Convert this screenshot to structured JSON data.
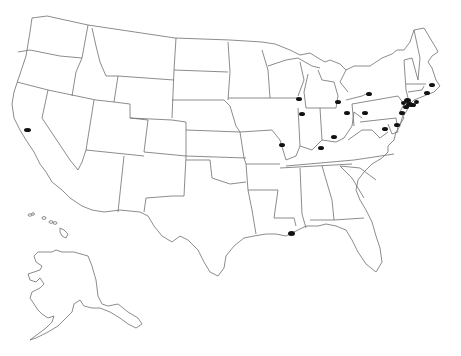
{
  "map": {
    "type": "us-states-outline",
    "background": "#ffffff",
    "outline_color": "#6e6e6e",
    "marker_color": "#111111",
    "insets": [
      "alaska",
      "hawaii"
    ]
  },
  "markers": [
    {
      "id": "san-francisco-ca",
      "x": 24,
      "y": 128,
      "w": 7,
      "h": 4
    },
    {
      "id": "new-orleans-la",
      "x": 288,
      "y": 231,
      "w": 7,
      "h": 5
    },
    {
      "id": "milwaukee-wi",
      "x": 296,
      "y": 97,
      "w": 6,
      "h": 4
    },
    {
      "id": "chicago-il",
      "x": 299,
      "y": 112,
      "w": 6,
      "h": 4
    },
    {
      "id": "st-louis-mo",
      "x": 279,
      "y": 143,
      "w": 6,
      "h": 4
    },
    {
      "id": "detroit-mi",
      "x": 335,
      "y": 100,
      "w": 6,
      "h": 4
    },
    {
      "id": "cleveland-oh",
      "x": 344,
      "y": 111,
      "w": 6,
      "h": 4
    },
    {
      "id": "cincinnati-oh",
      "x": 331,
      "y": 135,
      "w": 6,
      "h": 4
    },
    {
      "id": "louisville-ky",
      "x": 318,
      "y": 146,
      "w": 6,
      "h": 4
    },
    {
      "id": "buffalo-ny",
      "x": 366,
      "y": 92,
      "w": 6,
      "h": 4
    },
    {
      "id": "pittsburgh-pa",
      "x": 362,
      "y": 111,
      "w": 6,
      "h": 4
    },
    {
      "id": "washington-dc",
      "x": 382,
      "y": 127,
      "w": 6,
      "h": 4
    },
    {
      "id": "baltimore-md",
      "x": 394,
      "y": 123,
      "w": 6,
      "h": 4
    },
    {
      "id": "philadelphia-pa",
      "x": 399,
      "y": 111,
      "w": 6,
      "h": 4
    },
    {
      "id": "new-york-ny-1",
      "x": 404,
      "y": 98,
      "w": 7,
      "h": 5
    },
    {
      "id": "new-york-ny-2",
      "x": 406,
      "y": 102,
      "w": 7,
      "h": 5
    },
    {
      "id": "new-york-ny-3",
      "x": 403,
      "y": 105,
      "w": 6,
      "h": 4
    },
    {
      "id": "newark-nj",
      "x": 410,
      "y": 103,
      "w": 6,
      "h": 4
    },
    {
      "id": "hartford-ct",
      "x": 414,
      "y": 100,
      "w": 5,
      "h": 4
    },
    {
      "id": "providence-ri",
      "x": 424,
      "y": 91,
      "w": 6,
      "h": 4
    },
    {
      "id": "boston-ma",
      "x": 429,
      "y": 83,
      "w": 6,
      "h": 4
    },
    {
      "id": "jersey-city-nj",
      "x": 401,
      "y": 101,
      "w": 5,
      "h": 4
    }
  ]
}
